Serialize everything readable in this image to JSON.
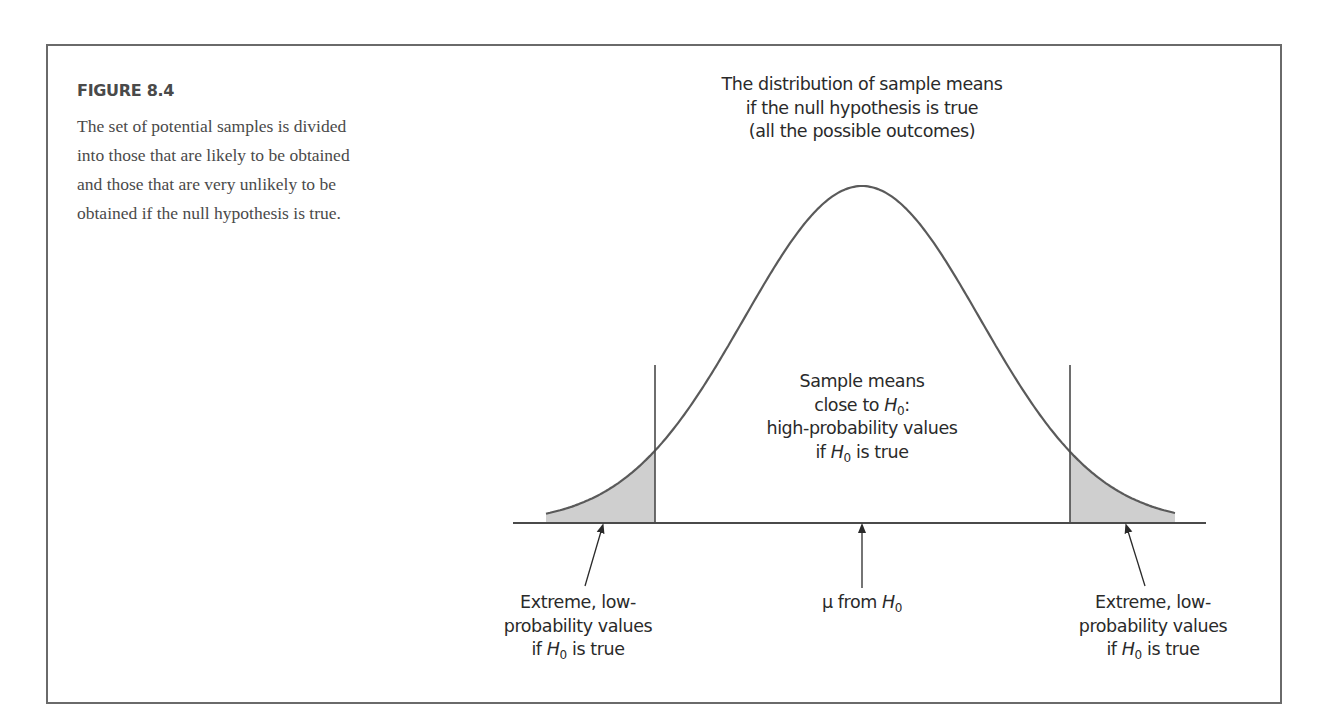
{
  "figure": {
    "number": "FIGURE 8.4",
    "caption": "The set of potential samples is divided into those that are likely to be obtained and those that are very unlikely to be obtained if the null hypothesis is true."
  },
  "labels": {
    "top": [
      "The distribution of sample means",
      "if the null hypothesis is true",
      "(all the possible outcomes)"
    ],
    "center": {
      "line1": "Sample means",
      "line2_pre": "close to ",
      "line2_sym": "H",
      "line2_sub": "0",
      "line2_post": ":",
      "line3": "high-probability values",
      "line4_pre": "if ",
      "line4_sym": "H",
      "line4_sub": "0",
      "line4_post": " is true"
    },
    "left_tail": {
      "line1": "Extreme, low-",
      "line2": "probability values",
      "line3_pre": "if ",
      "line3_sym": "H",
      "line3_sub": "0",
      "line3_post": " is true"
    },
    "mean": {
      "pre": "μ from ",
      "sym": "H",
      "sub": "0"
    },
    "right_tail": {
      "line1": "Extreme, low-",
      "line2": "probability values",
      "line3_pre": "if ",
      "line3_sym": "H",
      "line3_sub": "0",
      "line3_post": " is true"
    }
  },
  "chart_data": {
    "type": "area",
    "title": "The distribution of sample means if the null hypothesis is true (all the possible outcomes)",
    "distribution": "normal",
    "center_label": "μ from H0",
    "regions": [
      {
        "name": "left critical region",
        "shaded": true,
        "description": "Extreme, low-probability values if H0 is true"
      },
      {
        "name": "middle region",
        "shaded": false,
        "description": "Sample means close to H0: high-probability values if H0 is true"
      },
      {
        "name": "right critical region",
        "shaded": true,
        "description": "Extreme, low-probability values if H0 is true"
      }
    ],
    "geometry_px": {
      "baseline_y": 523,
      "baseline_x": [
        513,
        1206
      ],
      "mean_x": 862,
      "peak_y": 186,
      "sigma_px": 118,
      "curve_x": [
        546,
        1175
      ],
      "left_cutoff_x": 655,
      "right_cutoff_x": 1070,
      "cutoff_top_y": 365
    },
    "colors": {
      "curve": "#5a5a5a",
      "shade": "#cfcfcf",
      "lines": "#4a4a4a"
    }
  }
}
